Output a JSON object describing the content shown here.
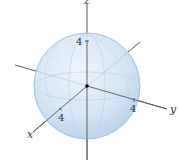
{
  "diagram": {
    "type": "3d-sphere",
    "axes": {
      "x": {
        "label": "x",
        "tick": "4"
      },
      "y": {
        "label": "y",
        "tick": "4"
      },
      "z": {
        "label": "z",
        "tick": "4"
      }
    },
    "colors": {
      "sphere_fill": "#c9dff2",
      "sphere_edge": "#8fb8db",
      "axis": "#444444",
      "origin": "#000000"
    }
  }
}
